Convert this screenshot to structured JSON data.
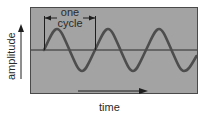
{
  "diagram": {
    "type": "sine-wave",
    "labels": {
      "cycle_line1": "one",
      "cycle_line2": "cycle",
      "y_axis": "amplitude",
      "x_axis": "time"
    },
    "colors": {
      "panel_fill": "#a3a3a3",
      "panel_border": "#4a4a4a",
      "wave": "#4d4d4d",
      "axis_line": "#2a2a2a",
      "text": "#2a2a2a"
    },
    "wave": {
      "cycles_shown": 3.0,
      "start_phase": "zero-crossing rising"
    }
  }
}
